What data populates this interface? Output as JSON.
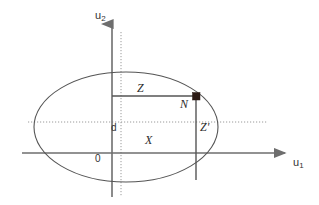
{
  "figure": {
    "width": 319,
    "height": 205,
    "background": "#ffffff"
  },
  "colors": {
    "axis": "#6e6e6e",
    "ellipse": "#555555",
    "guide_dotted": "#8f8f8f",
    "segment": "#555555",
    "marker": "#2b1a14",
    "text": "#2b2b2b"
  },
  "axes": {
    "vertical": {
      "label": "u",
      "subscript": "2",
      "x": 112,
      "y_top": 22,
      "y_bottom": 197
    },
    "horizontal": {
      "label": "u",
      "subscript": "1",
      "y": 153,
      "x_left": 22,
      "x_right": 288
    },
    "origin_label": "0"
  },
  "guides": {
    "vertical_dotted": {
      "x": 121,
      "y_top": 32,
      "y_bottom": 197
    },
    "horizontal_dotted": {
      "y": 122,
      "x_left": 28,
      "x_right": 268
    }
  },
  "shapes": {
    "ellipse": {
      "cx": 126,
      "cy": 127,
      "rx": 92,
      "ry": 55
    },
    "segment_z": {
      "x1": 112,
      "y1": 96,
      "x2": 196,
      "y2": 96
    },
    "segment_z_prime": {
      "x1": 196,
      "y1": 96,
      "x2": 196,
      "y2": 180
    },
    "marker_point": {
      "x": 196,
      "y": 96,
      "size": 7
    }
  },
  "labels": {
    "u2": {
      "text": "u",
      "sub": "2",
      "x": 95,
      "y": 10
    },
    "u1": {
      "text": "u",
      "sub": "1",
      "x": 293,
      "y": 157
    },
    "z": {
      "text": "Z",
      "x": 137,
      "y": 82
    },
    "n": {
      "text": "N",
      "x": 180,
      "y": 98
    },
    "z_prime": {
      "text": "Z'",
      "x": 200,
      "y": 121
    },
    "d": {
      "text": "d",
      "x": 111,
      "y": 123
    },
    "x_region": {
      "text": "X",
      "x": 145,
      "y": 134
    },
    "zero": {
      "text": "0",
      "x": 95,
      "y": 153
    }
  }
}
